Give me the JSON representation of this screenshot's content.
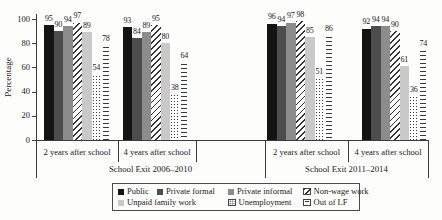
{
  "chart_data": {
    "type": "bar",
    "ylabel": "Percentage",
    "ylim": [
      0,
      100
    ],
    "yticks": [
      0,
      20,
      40,
      60,
      80,
      100
    ],
    "grid": false,
    "legend_position": "bottom-boxed",
    "series": [
      {
        "name": "Public",
        "style": "solid-black",
        "color": "#141414"
      },
      {
        "name": "Private formal",
        "style": "solid-dark-gray",
        "color": "#4d4d4d"
      },
      {
        "name": "Private informal",
        "style": "solid-gray",
        "color": "#8c8c8c"
      },
      {
        "name": "Non-wage work",
        "style": "diagonal-hatch",
        "color": "#333333"
      },
      {
        "name": "Unpaid family work",
        "style": "solid-light-gray",
        "color": "#c9c9c9"
      },
      {
        "name": "Unemployment",
        "style": "dots",
        "color": "#3a3a3a"
      },
      {
        "name": "Out of LF",
        "style": "horizontal-dashes",
        "color": "#3a3a3a"
      }
    ],
    "regions": [
      "School Exit 2006–2010",
      "School Exit 2011–2014"
    ],
    "groups": [
      {
        "category": "2 years after school",
        "region_index": 0,
        "values": [
          95,
          90,
          94,
          97,
          89,
          54,
          78
        ]
      },
      {
        "category": "4 years after school",
        "region_index": 0,
        "values": [
          93,
          84,
          89,
          95,
          80,
          38,
          64
        ]
      },
      {
        "category": "2 years after school",
        "region_index": 1,
        "values": [
          96,
          94,
          97,
          98,
          85,
          51,
          86
        ]
      },
      {
        "category": "4 years after school",
        "region_index": 1,
        "values": [
          92,
          94,
          94,
          90,
          61,
          36,
          74
        ]
      }
    ],
    "legend_rows": [
      [
        0,
        1,
        2,
        3
      ],
      [
        4,
        5,
        6
      ]
    ]
  },
  "colors": {
    "axis": "#3c3c3c",
    "text": "#1a1a1a",
    "background": "#fdfdfc"
  }
}
